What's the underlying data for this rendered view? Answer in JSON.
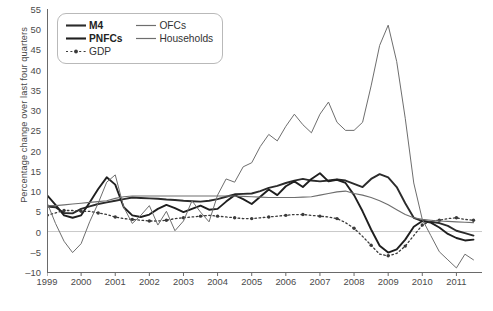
{
  "chart_data": {
    "type": "line",
    "title": "",
    "xlabel": "",
    "ylabel": "Percentage change over last four quarters",
    "xlim": [
      1999.0,
      2011.75
    ],
    "ylim": [
      -10,
      55
    ],
    "yticks": [
      55,
      50,
      45,
      40,
      35,
      30,
      25,
      20,
      15,
      10,
      5,
      0,
      -5,
      -10
    ],
    "xticks": [
      1999,
      2000,
      2001,
      2002,
      2003,
      2004,
      2005,
      2006,
      2007,
      2008,
      2009,
      2010,
      2011
    ],
    "grid": false,
    "zero_line": true,
    "legend_position": "top-left",
    "x": [
      1999.0,
      1999.25,
      1999.5,
      1999.75,
      2000.0,
      2000.25,
      2000.5,
      2000.75,
      2001.0,
      2001.25,
      2001.5,
      2001.75,
      2002.0,
      2002.25,
      2002.5,
      2002.75,
      2003.0,
      2003.25,
      2003.5,
      2003.75,
      2004.0,
      2004.25,
      2004.5,
      2004.75,
      2005.0,
      2005.25,
      2005.5,
      2005.75,
      2006.0,
      2006.25,
      2006.5,
      2006.75,
      2007.0,
      2007.25,
      2007.5,
      2007.75,
      2008.0,
      2008.25,
      2008.5,
      2008.75,
      2009.0,
      2009.25,
      2009.5,
      2009.75,
      2010.0,
      2010.25,
      2010.5,
      2010.75,
      2011.0,
      2011.25,
      2011.5
    ],
    "series": [
      {
        "name": "M4",
        "style": "solid-bold",
        "color": "#2b2b2b",
        "width": 1.9,
        "values": [
          6.2,
          6.0,
          4.6,
          4.5,
          5.6,
          6.2,
          6.8,
          7.2,
          7.6,
          8.0,
          8.4,
          8.3,
          8.2,
          8.1,
          7.9,
          7.8,
          7.6,
          7.5,
          7.4,
          7.6,
          8.0,
          8.6,
          9.2,
          9.3,
          9.4,
          10.0,
          10.8,
          11.3,
          12.0,
          12.6,
          13.0,
          12.6,
          12.4,
          12.6,
          12.9,
          12.6,
          11.8,
          11.0,
          13.0,
          14.2,
          13.4,
          11.0,
          7.0,
          3.4,
          2.6,
          2.4,
          2.1,
          1.4,
          0.2,
          -0.4,
          -1.0
        ]
      },
      {
        "name": "PNFCs",
        "style": "solid-bold",
        "color": "#1f1f1f",
        "width": 1.9,
        "values": [
          9.0,
          6.6,
          4.0,
          3.4,
          4.0,
          7.2,
          10.5,
          13.4,
          11.6,
          6.0,
          4.0,
          3.6,
          4.2,
          5.6,
          6.6,
          5.8,
          4.8,
          5.6,
          6.4,
          5.4,
          5.6,
          7.4,
          9.0,
          8.0,
          6.8,
          8.6,
          10.4,
          9.0,
          11.2,
          12.4,
          11.0,
          13.0,
          14.4,
          12.4,
          12.8,
          12.0,
          9.0,
          5.0,
          0.5,
          -3.5,
          -5.2,
          -4.4,
          -2.0,
          1.2,
          2.6,
          2.2,
          1.0,
          -0.6,
          -1.6,
          -2.2,
          -2.0
        ]
      },
      {
        "name": "GDP",
        "style": "dotted-marker",
        "color": "#3a3a3a",
        "width": 1.3,
        "values": [
          4.0,
          4.6,
          5.2,
          5.2,
          5.0,
          5.0,
          4.6,
          4.2,
          3.6,
          3.2,
          3.0,
          2.8,
          2.6,
          2.6,
          2.8,
          3.2,
          3.4,
          3.6,
          3.8,
          4.0,
          3.8,
          3.6,
          3.4,
          3.2,
          3.2,
          3.4,
          3.6,
          3.8,
          4.0,
          4.2,
          4.2,
          4.0,
          3.8,
          3.6,
          3.2,
          2.2,
          0.8,
          -1.2,
          -3.4,
          -5.6,
          -6.0,
          -5.4,
          -3.6,
          -1.0,
          1.6,
          2.6,
          2.8,
          3.2,
          3.4,
          3.0,
          2.8
        ]
      },
      {
        "name": "OFCs",
        "style": "solid-thin",
        "color": "#6e6e6e",
        "width": 1.0,
        "values": [
          7.2,
          2.0,
          -2.4,
          -5.2,
          -3.0,
          2.4,
          7.0,
          12.2,
          14.0,
          6.0,
          2.0,
          4.0,
          6.4,
          1.6,
          5.0,
          0.2,
          2.6,
          7.6,
          4.8,
          2.4,
          9.0,
          13.0,
          12.2,
          16.0,
          17.0,
          21.0,
          24.0,
          22.4,
          26.0,
          29.0,
          26.4,
          24.4,
          29.0,
          32.0,
          27.0,
          25.0,
          25.0,
          27.0,
          36.0,
          46.0,
          51.0,
          42.0,
          28.0,
          12.0,
          3.0,
          -1.0,
          -5.0,
          -7.0,
          -9.0,
          -5.6,
          -7.0
        ]
      },
      {
        "name": "Households",
        "style": "solid-thin",
        "color": "#6e6e6e",
        "width": 1.1,
        "values": [
          6.4,
          6.4,
          6.6,
          6.8,
          7.0,
          7.2,
          7.4,
          7.6,
          8.2,
          8.6,
          8.8,
          8.8,
          8.8,
          8.8,
          8.8,
          8.8,
          8.8,
          8.8,
          8.8,
          8.8,
          8.8,
          8.8,
          8.8,
          8.7,
          8.6,
          8.5,
          8.4,
          8.4,
          8.4,
          8.4,
          8.5,
          8.6,
          9.0,
          9.4,
          9.8,
          10.0,
          9.4,
          9.0,
          8.4,
          7.6,
          6.6,
          5.4,
          4.2,
          3.4,
          3.0,
          2.8,
          2.6,
          2.5,
          2.4,
          2.3,
          2.2
        ]
      }
    ]
  },
  "axis": {
    "y_title": "Percentage change over last four quarters",
    "y_tick_labels": [
      "55",
      "50",
      "45",
      "40",
      "35",
      "30",
      "25",
      "20",
      "15",
      "10",
      "5",
      "0",
      "–5",
      "–10"
    ],
    "x_tick_labels": [
      "1999",
      "2000",
      "2001",
      "2002",
      "2003",
      "2004",
      "2005",
      "2006",
      "2007",
      "2008",
      "2009",
      "2010",
      "2011"
    ]
  },
  "legend": {
    "entries": [
      {
        "label": "M4",
        "style": "solid-bold",
        "color": "#2b2b2b",
        "bold": true
      },
      {
        "label": "OFCs",
        "style": "solid-thin",
        "color": "#6e6e6e",
        "bold": false
      },
      {
        "label": "PNFCs",
        "style": "solid-bold",
        "color": "#1f1f1f",
        "bold": true
      },
      {
        "label": "Households",
        "style": "solid-thin",
        "color": "#6e6e6e",
        "bold": false
      },
      {
        "label": "GDP",
        "style": "dotted-marker",
        "color": "#3a3a3a",
        "bold": false
      }
    ]
  },
  "colors": {
    "axis": "#6a6a6a",
    "zero_line": "#c9c9c9",
    "text": "#4a4a4a",
    "legend_border": "#b9b9b9",
    "background": "#ffffff"
  }
}
